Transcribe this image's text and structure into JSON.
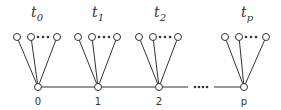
{
  "diagram": {
    "groups": [
      {
        "base_label": "0",
        "t_name": "t",
        "t_sub": "0",
        "cx": 38,
        "leaves": [
          17,
          31,
          57
        ]
      },
      {
        "base_label": "1",
        "t_name": "t",
        "t_sub": "1",
        "cx": 98,
        "leaves": [
          78,
          92,
          117
        ]
      },
      {
        "base_label": "2",
        "t_name": "t",
        "t_sub": "2",
        "cx": 159,
        "leaves": [
          139,
          153,
          178
        ]
      },
      {
        "base_label": "p",
        "t_name": "t",
        "t_sub": "p",
        "cx": 244,
        "leaves": [
          225,
          239,
          266
        ]
      }
    ],
    "colors": {
      "stroke": "#333333",
      "fill": "#ffffff"
    }
  }
}
